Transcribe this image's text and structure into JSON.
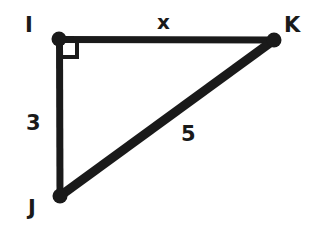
{
  "figure": {
    "type": "right-triangle-diagram",
    "background_color": "#ffffff",
    "stroke_color": "#1a1a1a",
    "vertices": [
      {
        "id": "I",
        "label": "I",
        "x": 59,
        "y": 39,
        "right_angle": true
      },
      {
        "id": "J",
        "label": "J",
        "x": 60,
        "y": 196,
        "right_angle": false
      },
      {
        "id": "K",
        "label": "K",
        "x": 274,
        "y": 40,
        "right_angle": false
      }
    ],
    "vertex_dot_radius": 7,
    "edges": [
      {
        "id": "IK",
        "from": "I",
        "to": "K",
        "label": "x",
        "label_x": 165,
        "label_y": 22,
        "thickness": 7
      },
      {
        "id": "IJ",
        "from": "I",
        "to": "J",
        "label": "3",
        "label_x": 33,
        "label_y": 124,
        "thickness": 7
      },
      {
        "id": "JK",
        "from": "J",
        "to": "K",
        "label": "5",
        "label_x": 188,
        "label_y": 135,
        "thickness": 9
      }
    ],
    "right_angle_marker": {
      "at_vertex": "I",
      "size": 17,
      "thickness": 4
    },
    "labels": {
      "vertex_I": "I",
      "vertex_J": "J",
      "vertex_K": "K",
      "side_IK": "x",
      "side_IJ": "3",
      "side_JK": "5"
    }
  }
}
